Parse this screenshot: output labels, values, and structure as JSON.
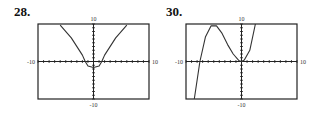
{
  "chart_data": [
    {
      "type": "line",
      "label": "28.",
      "title": "",
      "xlim": [
        -10,
        10
      ],
      "ylim": [
        -10,
        10
      ],
      "tick_labels": {
        "top": "10",
        "bottom": "-10",
        "left": "-10",
        "right": "10"
      },
      "series": [
        {
          "name": "curve",
          "x": [
            -6,
            -4,
            -2,
            -1.5,
            -1,
            0,
            1,
            1.5,
            2,
            4,
            6
          ],
          "y": [
            9.7,
            6.3,
            1.7,
            0,
            -1.2,
            -1.6,
            -1.2,
            0,
            1.7,
            6.3,
            9.7
          ]
        }
      ]
    },
    {
      "type": "line",
      "label": "30.",
      "title": "",
      "xlim": [
        -10,
        10
      ],
      "ylim": [
        -10,
        10
      ],
      "tick_labels": {
        "top": "10",
        "bottom": "-10",
        "left": "-10",
        "right": "10"
      },
      "series": [
        {
          "name": "curve",
          "x": [
            -8.5,
            -7.5,
            -6.5,
            -5.5,
            -4.5,
            -3.5,
            -2.5,
            -1.5,
            -0.5,
            0,
            0.5,
            1.5,
            2.5
          ],
          "y": [
            -10,
            0,
            6.5,
            9.5,
            9.5,
            7.5,
            4.5,
            2,
            0.3,
            0,
            0.4,
            3,
            10
          ]
        }
      ]
    }
  ]
}
